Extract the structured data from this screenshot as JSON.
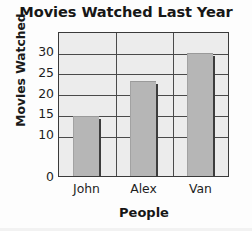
{
  "chart_data": {
    "type": "bar",
    "title": "Movies Watched Last Year",
    "xlabel": "People",
    "ylabel": "Movies Watched",
    "categories": [
      "John",
      "Alex",
      "Van"
    ],
    "values": [
      14.5,
      23,
      29.8
    ],
    "ylim": [
      0,
      35
    ],
    "yticks": [
      0,
      10,
      15,
      20,
      25,
      30
    ],
    "ytick_labels": [
      "0",
      "10",
      "15",
      "20",
      "25",
      "30"
    ],
    "gridlines": [
      10,
      15,
      20,
      25,
      30
    ],
    "grid": true,
    "legend": null,
    "series": [
      {
        "name": "Movies Watched",
        "values": [
          14.5,
          23,
          29.8
        ]
      }
    ]
  },
  "colors": {
    "bar_fill": "#b6b6b6",
    "plot_background": "#ececec",
    "axis_line": "#3a3a3a",
    "gridline": "#4a4a4a",
    "text": "#1a1a1a"
  }
}
